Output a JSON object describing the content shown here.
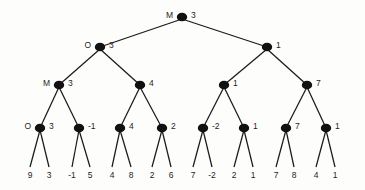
{
  "chart_data": {
    "type": "diagram",
    "title": "",
    "diagram_kind": "minimax-game-tree",
    "depth": 5,
    "node_color": "#111111",
    "edge_color": "#1a1a1a",
    "background": "#fdfdfb",
    "role_labels": {
      "max": "M",
      "min": "O"
    },
    "levels": [
      {
        "level": 0,
        "name": "root",
        "nodes": [
          {
            "id": "n0",
            "value": "3",
            "role_label": "M",
            "x": 182,
            "y": 17
          }
        ]
      },
      {
        "level": 1,
        "name": "level-1",
        "nodes": [
          {
            "id": "n1",
            "value": "3",
            "role_label": "O",
            "x": 100,
            "y": 47
          },
          {
            "id": "n2",
            "value": "1",
            "role_label": "",
            "x": 267,
            "y": 47
          }
        ]
      },
      {
        "level": 2,
        "name": "level-2",
        "nodes": [
          {
            "id": "n3",
            "value": "3",
            "role_label": "M",
            "x": 59,
            "y": 85
          },
          {
            "id": "n4",
            "value": "4",
            "role_label": "",
            "x": 140,
            "y": 85
          },
          {
            "id": "n5",
            "value": "1",
            "role_label": "",
            "x": 224,
            "y": 85
          },
          {
            "id": "n6",
            "value": "7",
            "role_label": "",
            "x": 307,
            "y": 85
          }
        ]
      },
      {
        "level": 3,
        "name": "level-3",
        "nodes": [
          {
            "id": "n7",
            "value": "3",
            "role_label": "O",
            "x": 40,
            "y": 128
          },
          {
            "id": "n8",
            "value": "-1",
            "role_label": "",
            "x": 79,
            "y": 128
          },
          {
            "id": "n9",
            "value": "4",
            "role_label": "",
            "x": 120,
            "y": 128
          },
          {
            "id": "n10",
            "value": "2",
            "role_label": "",
            "x": 162,
            "y": 128
          },
          {
            "id": "n11",
            "value": "-2",
            "role_label": "",
            "x": 203,
            "y": 128
          },
          {
            "id": "n12",
            "value": "1",
            "role_label": "",
            "x": 244,
            "y": 128
          },
          {
            "id": "n13",
            "value": "7",
            "role_label": "",
            "x": 286,
            "y": 128
          },
          {
            "id": "n14",
            "value": "1",
            "role_label": "",
            "x": 326,
            "y": 128
          }
        ]
      },
      {
        "level": 4,
        "name": "leaves",
        "nodes": [
          {
            "id": "l0",
            "value": "9",
            "x": 30,
            "y": 176
          },
          {
            "id": "l1",
            "value": "3",
            "x": 49,
            "y": 176
          },
          {
            "id": "l2",
            "value": "-1",
            "x": 72,
            "y": 176
          },
          {
            "id": "l3",
            "value": "5",
            "x": 90,
            "y": 176
          },
          {
            "id": "l4",
            "value": "4",
            "x": 112,
            "y": 176
          },
          {
            "id": "l5",
            "value": "8",
            "x": 131,
            "y": 176
          },
          {
            "id": "l6",
            "value": "2",
            "x": 152,
            "y": 176
          },
          {
            "id": "l7",
            "value": "6",
            "x": 171,
            "y": 176
          },
          {
            "id": "l8",
            "value": "7",
            "x": 193,
            "y": 176
          },
          {
            "id": "l9",
            "value": "-2",
            "x": 212,
            "y": 176
          },
          {
            "id": "l10",
            "value": "2",
            "x": 234,
            "y": 176
          },
          {
            "id": "l11",
            "value": "1",
            "x": 253,
            "y": 176
          },
          {
            "id": "l12",
            "value": "7",
            "x": 276,
            "y": 176
          },
          {
            "id": "l13",
            "value": "8",
            "x": 294,
            "y": 176
          },
          {
            "id": "l14",
            "value": "4",
            "x": 316,
            "y": 176
          },
          {
            "id": "l15",
            "value": "1",
            "x": 335,
            "y": 176
          }
        ]
      }
    ],
    "edges": [
      {
        "from": "n0",
        "to": "n1"
      },
      {
        "from": "n0",
        "to": "n2"
      },
      {
        "from": "n1",
        "to": "n3"
      },
      {
        "from": "n1",
        "to": "n4"
      },
      {
        "from": "n2",
        "to": "n5"
      },
      {
        "from": "n2",
        "to": "n6"
      },
      {
        "from": "n3",
        "to": "n7"
      },
      {
        "from": "n3",
        "to": "n8"
      },
      {
        "from": "n4",
        "to": "n9"
      },
      {
        "from": "n4",
        "to": "n10"
      },
      {
        "from": "n5",
        "to": "n11"
      },
      {
        "from": "n5",
        "to": "n12"
      },
      {
        "from": "n6",
        "to": "n13"
      },
      {
        "from": "n6",
        "to": "n14"
      },
      {
        "from": "n7",
        "to": "l0"
      },
      {
        "from": "n7",
        "to": "l1"
      },
      {
        "from": "n8",
        "to": "l2"
      },
      {
        "from": "n8",
        "to": "l3"
      },
      {
        "from": "n9",
        "to": "l4"
      },
      {
        "from": "n9",
        "to": "l5"
      },
      {
        "from": "n10",
        "to": "l6"
      },
      {
        "from": "n10",
        "to": "l7"
      },
      {
        "from": "n11",
        "to": "l8"
      },
      {
        "from": "n11",
        "to": "l9"
      },
      {
        "from": "n12",
        "to": "l10"
      },
      {
        "from": "n12",
        "to": "l11"
      },
      {
        "from": "n13",
        "to": "l12"
      },
      {
        "from": "n13",
        "to": "l13"
      },
      {
        "from": "n14",
        "to": "l14"
      },
      {
        "from": "n14",
        "to": "l15"
      }
    ]
  }
}
